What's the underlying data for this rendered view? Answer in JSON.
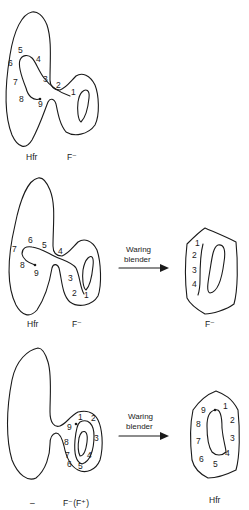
{
  "panels": [
    {
      "id": "panel-1",
      "left_label": "Hfr",
      "right_label": "F⁻",
      "markers": [
        "1",
        "2",
        "3",
        "4",
        "5",
        "6",
        "7",
        "8",
        "9"
      ]
    },
    {
      "id": "panel-2",
      "left_label": "Hfr",
      "right_label": "F⁻",
      "markers": [
        "1",
        "2",
        "3",
        "4",
        "5",
        "6",
        "7",
        "8",
        "9"
      ],
      "arrow_label_line1": "Waring",
      "arrow_label_line2": "blender",
      "result_label": "F⁻",
      "result_markers": [
        "1",
        "2",
        "3",
        "4"
      ]
    },
    {
      "id": "panel-3",
      "left_label": "–",
      "right_label": "F⁻(F⁺)",
      "markers": [
        "1",
        "2",
        "3",
        "4",
        "5",
        "6",
        "7",
        "8",
        "9"
      ],
      "arrow_label_line1": "Waring",
      "arrow_label_line2": "blender",
      "result_label": "Hfr",
      "result_markers": [
        "1",
        "2",
        "3",
        "4",
        "5",
        "6",
        "7",
        "8",
        "9"
      ]
    }
  ]
}
